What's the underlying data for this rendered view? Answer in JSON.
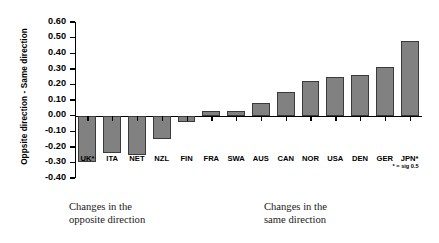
{
  "chart_data": {
    "type": "bar",
    "title": "",
    "xlabel": "",
    "ylabel": "Oppsite direction  -  Same direction",
    "ylim": [
      -0.4,
      0.6
    ],
    "ytick_step": 0.1,
    "grid": false,
    "legend": null,
    "bar_color": "#818181",
    "bar_edge_color": "#3a3a3a",
    "categories": [
      "UK*",
      "ITA",
      "NET",
      "NZL",
      "FIN",
      "FRA",
      "SWA",
      "AUS",
      "CAN",
      "NOR",
      "USA",
      "DEN",
      "GER",
      "JPN*"
    ],
    "values": [
      -0.3,
      -0.24,
      -0.25,
      -0.15,
      -0.04,
      0.03,
      0.03,
      0.08,
      0.15,
      0.22,
      0.25,
      0.26,
      0.31,
      0.48
    ],
    "ytick_labels": [
      "0.60",
      "0.50",
      "0.40",
      "0.30",
      "0.20",
      "0.10",
      "0.00",
      "-0.10",
      "-0.20",
      "-0.30",
      "-0.40"
    ],
    "ytick_values": [
      0.6,
      0.5,
      0.4,
      0.3,
      0.2,
      0.1,
      0.0,
      -0.1,
      -0.2,
      -0.3,
      -0.4
    ],
    "annotations": [
      {
        "name": "significance-footnote",
        "text": "* = sig 0.5"
      },
      {
        "name": "caption-opposite",
        "text": "Changes in the\nopposite direction"
      },
      {
        "name": "caption-same",
        "text": "Changes in the\nsame direction"
      }
    ]
  },
  "footnote": "* = sig 0.5",
  "captions": {
    "opposite": "Changes in the\nopposite direction",
    "same": "Changes in the\nsame direction"
  }
}
